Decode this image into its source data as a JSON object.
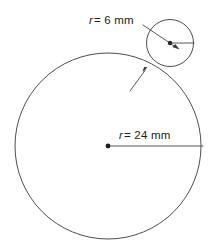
{
  "figure": {
    "name": "two-tangent-circles-diagram",
    "type": "geometry-diagram",
    "background_color": "#ffffff",
    "stroke_color": "#3a3a3a",
    "text_color": "#1c1c1c",
    "width": 209,
    "height": 249
  },
  "labels": {
    "small_circle": {
      "variable": "r",
      "rest": "= 6 mm",
      "full": "r = 6 mm",
      "value": 6,
      "unit": "mm"
    },
    "big_circle": {
      "variable": "r",
      "rest": "= 24 mm",
      "full": "r = 24 mm",
      "value": 24,
      "unit": "mm"
    }
  },
  "shapes": {
    "big_circle": {
      "name": "large-circle",
      "cx": 108,
      "cy": 146,
      "r": 93,
      "radius_label": "r = 24 mm"
    },
    "small_circle": {
      "name": "small-circle",
      "cx": 170,
      "cy": 43,
      "r": 23.5,
      "radius_label": "r = 6 mm"
    },
    "big_radius_line": {
      "name": "large-circle-radius-line",
      "x1": 108,
      "y1": 146,
      "x2": 203,
      "y2": 146
    },
    "small_radius_line": {
      "name": "small-circle-radius-line",
      "x1": 170,
      "y1": 43,
      "x2": 194,
      "y2": 43
    },
    "leader_to_small_radius": {
      "name": "leader-line-small-radius",
      "x1": 143,
      "y1": 25,
      "x2": 177,
      "y2": 48
    },
    "leader_to_tangent_point": {
      "name": "leader-line-tangent-point",
      "x1": 131,
      "y1": 90,
      "x2": 146,
      "y2": 69
    },
    "tangent_point": {
      "name": "tangency-point",
      "x": 147,
      "y": 67
    }
  },
  "icons": {
    "arrow_small_radius": "arrow-head-icon",
    "arrow_tangent": "arrow-head-icon",
    "center_dot_big": "center-point-dot-icon",
    "center_dot_small": "center-point-dot-icon"
  }
}
